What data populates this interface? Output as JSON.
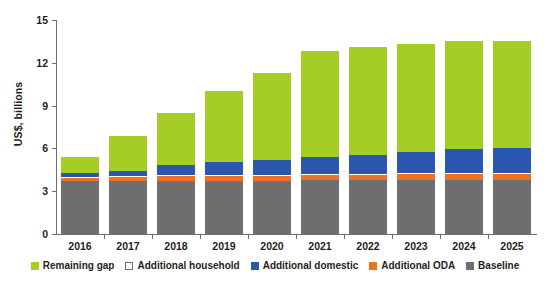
{
  "chart_data": {
    "type": "bar",
    "stacked": true,
    "title": "",
    "xlabel": "",
    "ylabel": "US$, billions",
    "ylim": [
      0,
      15
    ],
    "yticks": [
      0,
      3,
      6,
      9,
      12,
      15
    ],
    "grid": false,
    "legend_position": "bottom",
    "categories": [
      "2016",
      "2017",
      "2018",
      "2019",
      "2020",
      "2021",
      "2022",
      "2023",
      "2024",
      "2025"
    ],
    "series": [
      {
        "name": "Baseline",
        "color": "#6e6e6e",
        "values": [
          3.7,
          3.7,
          3.75,
          3.75,
          3.75,
          3.78,
          3.78,
          3.8,
          3.8,
          3.8
        ]
      },
      {
        "name": "Additional ODA",
        "color": "#ee7023",
        "values": [
          0.25,
          0.3,
          0.32,
          0.35,
          0.35,
          0.38,
          0.38,
          0.4,
          0.4,
          0.4
        ]
      },
      {
        "name": "Additional household",
        "color": "#ffffff",
        "values": [
          0.05,
          0.05,
          0.05,
          0.05,
          0.05,
          0.05,
          0.05,
          0.05,
          0.05,
          0.05
        ]
      },
      {
        "name": "Additional domestic",
        "color": "#2b56b0",
        "values": [
          0.25,
          0.4,
          0.75,
          0.9,
          1.05,
          1.2,
          1.35,
          1.5,
          1.7,
          1.8
        ]
      },
      {
        "name": "Remaining gap",
        "color": "#a5ce24",
        "values": [
          1.15,
          2.45,
          3.63,
          4.95,
          6.1,
          7.39,
          7.54,
          7.55,
          7.55,
          7.45
        ]
      }
    ],
    "totals": [
      5.4,
      6.9,
      8.5,
      10.0,
      11.3,
      12.8,
      13.1,
      13.3,
      13.5,
      13.5
    ]
  },
  "axis": {
    "y_title": "US$, billions",
    "y_tick_labels": [
      "15",
      "12",
      "9",
      "6",
      "3",
      "0"
    ],
    "x_tick_labels": [
      "2016",
      "2017",
      "2018",
      "2019",
      "2020",
      "2021",
      "2022",
      "2023",
      "2024",
      "2025"
    ]
  },
  "legend": {
    "items": [
      {
        "label": "Remaining gap",
        "icon": "square-swatch-green"
      },
      {
        "label": "Additional household",
        "icon": "square-swatch-white-outline"
      },
      {
        "label": "Additional domestic",
        "icon": "square-swatch-blue"
      },
      {
        "label": "Additional ODA",
        "icon": "square-swatch-orange"
      },
      {
        "label": "Baseline",
        "icon": "square-swatch-gray"
      }
    ]
  },
  "colors": {
    "remaining_gap": "#a5ce24",
    "additional_household": "#ffffff",
    "additional_domestic": "#2b56b0",
    "additional_oda": "#ee7023",
    "baseline": "#6e6e6e",
    "axis": "#6d6e70",
    "text": "#231f20",
    "background": "#ffffff"
  }
}
